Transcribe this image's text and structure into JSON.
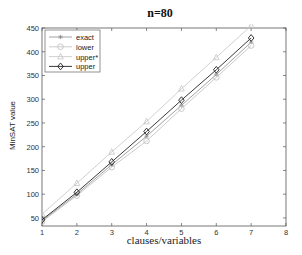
{
  "chart_data": {
    "type": "line",
    "title": "n=80",
    "xlabel": "clauses/variables",
    "ylabel": "MinSAT value",
    "x": [
      1,
      2,
      3,
      4,
      5,
      6,
      7
    ],
    "xlim": [
      1,
      8
    ],
    "ylim": [
      33,
      450
    ],
    "xticks": [
      1,
      2,
      3,
      4,
      5,
      6,
      7,
      8
    ],
    "yticks": [
      50,
      100,
      150,
      200,
      250,
      300,
      350,
      400,
      450
    ],
    "grid": false,
    "box": true,
    "legend_position": "upper left",
    "series": [
      {
        "name": "exact",
        "marker": "asterisk",
        "color": "#8a8a8a",
        "values": [
          44,
          100,
          162,
          222,
          287,
          352,
          420
        ]
      },
      {
        "name": "lower",
        "marker": "circle",
        "color": "#bdbdbd",
        "values": [
          42,
          97,
          157,
          212,
          280,
          346,
          413
        ]
      },
      {
        "name": "upper*",
        "marker": "triangle",
        "color": "#c4c4c4",
        "values": [
          58,
          123,
          189,
          253,
          322,
          388,
          455
        ]
      },
      {
        "name": "upper",
        "marker": "diamond",
        "color": "#222222",
        "values": [
          46,
          104,
          168,
          232,
          298,
          362,
          429
        ]
      }
    ]
  }
}
